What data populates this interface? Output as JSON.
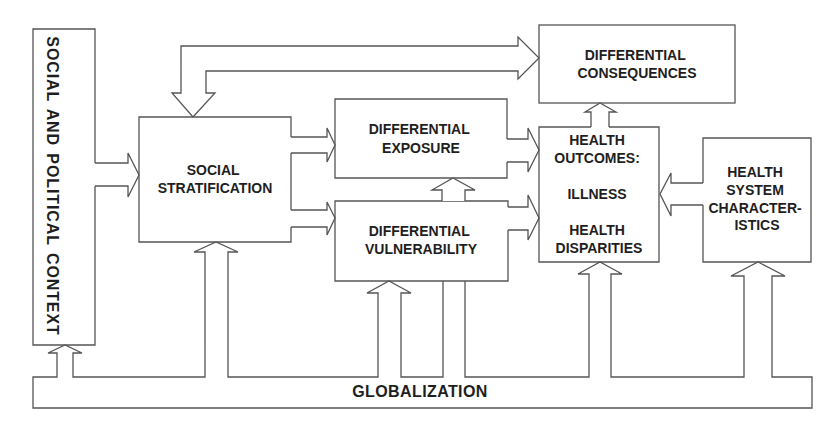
{
  "diagram": {
    "colors": {
      "stroke": "#555555",
      "text": "#1e1e1e",
      "background": "#ffffff"
    },
    "nodes": {
      "social_political_context": {
        "label": "SOCIAL AND POLITICAL CONTEXT"
      },
      "social_stratification": {
        "lines": [
          "SOCIAL",
          "STRATIFICATION"
        ]
      },
      "differential_exposure": {
        "lines": [
          "DIFFERENTIAL",
          "EXPOSURE"
        ]
      },
      "differential_vulnerability": {
        "lines": [
          "DIFFERENTIAL",
          "VULNERABILITY"
        ]
      },
      "differential_consequences": {
        "lines": [
          "DIFFERENTIAL",
          "CONSEQUENCES"
        ]
      },
      "health_outcomes": {
        "lines": [
          "HEALTH",
          "OUTCOMES:",
          "ILLNESS",
          "HEALTH",
          "DISPARITIES"
        ]
      },
      "health_system": {
        "lines": [
          "HEALTH",
          "SYSTEM",
          "CHARACTER-",
          "ISTICS"
        ]
      },
      "globalization": {
        "label": "GLOBALIZATION"
      }
    },
    "edges": [
      {
        "from": "SOCIAL AND POLITICAL CONTEXT",
        "to": "SOCIAL STRATIFICATION"
      },
      {
        "from": "SOCIAL STRATIFICATION",
        "to": "DIFFERENTIAL EXPOSURE"
      },
      {
        "from": "SOCIAL STRATIFICATION",
        "to": "DIFFERENTIAL VULNERABILITY"
      },
      {
        "from": "DIFFERENTIAL VULNERABILITY",
        "to": "DIFFERENTIAL EXPOSURE"
      },
      {
        "from": "DIFFERENTIAL EXPOSURE",
        "to": "HEALTH OUTCOMES"
      },
      {
        "from": "DIFFERENTIAL VULNERABILITY",
        "to": "HEALTH OUTCOMES"
      },
      {
        "from": "HEALTH SYSTEM CHARACTERISTICS",
        "to": "HEALTH OUTCOMES"
      },
      {
        "from": "HEALTH OUTCOMES",
        "to": "DIFFERENTIAL CONSEQUENCES"
      },
      {
        "from": "DIFFERENTIAL CONSEQUENCES",
        "to": "SOCIAL STRATIFICATION",
        "bidirectional": true
      },
      {
        "from": "GLOBALIZATION",
        "to": "SOCIAL AND POLITICAL CONTEXT"
      },
      {
        "from": "GLOBALIZATION",
        "to": "SOCIAL STRATIFICATION"
      },
      {
        "from": "GLOBALIZATION",
        "to": "DIFFERENTIAL VULNERABILITY"
      },
      {
        "from": "GLOBALIZATION",
        "to": "DIFFERENTIAL EXPOSURE"
      },
      {
        "from": "GLOBALIZATION",
        "to": "HEALTH OUTCOMES"
      },
      {
        "from": "GLOBALIZATION",
        "to": "HEALTH SYSTEM CHARACTERISTICS"
      }
    ]
  }
}
